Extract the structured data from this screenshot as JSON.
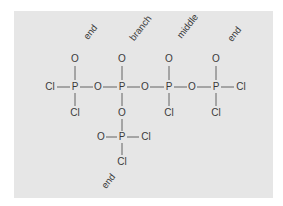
{
  "diagram": {
    "title": "",
    "background_color": "#e6e6e6",
    "text_color": "#3a3a3a",
    "labels": [
      {
        "text": "end",
        "x": 93,
        "y": 34
      },
      {
        "text": "branch",
        "x": 143,
        "y": 30
      },
      {
        "text": "middle",
        "x": 190,
        "y": 28
      },
      {
        "text": "end",
        "x": 237,
        "y": 36
      },
      {
        "text": "end",
        "x": 111,
        "y": 183
      }
    ],
    "atoms": [
      {
        "id": "cl_left",
        "symbol": "Cl",
        "x": 50,
        "y": 90
      },
      {
        "id": "p1",
        "symbol": "P",
        "x": 75,
        "y": 90
      },
      {
        "id": "p1_o_top",
        "symbol": "O",
        "x": 75,
        "y": 62
      },
      {
        "id": "p1_cl_bottom",
        "symbol": "Cl",
        "x": 75,
        "y": 116
      },
      {
        "id": "o_bridge1",
        "symbol": "O",
        "x": 98,
        "y": 90
      },
      {
        "id": "p2",
        "symbol": "P",
        "x": 122,
        "y": 90
      },
      {
        "id": "p2_o_top",
        "symbol": "O",
        "x": 122,
        "y": 62
      },
      {
        "id": "p2_o_bottom",
        "symbol": "O",
        "x": 122,
        "y": 116
      },
      {
        "id": "o_bridge2",
        "symbol": "O",
        "x": 145,
        "y": 90
      },
      {
        "id": "p3",
        "symbol": "P",
        "x": 169,
        "y": 90
      },
      {
        "id": "p3_o_top",
        "symbol": "O",
        "x": 169,
        "y": 62
      },
      {
        "id": "p3_cl_bottom",
        "symbol": "Cl",
        "x": 169,
        "y": 116
      },
      {
        "id": "o_bridge3",
        "symbol": "O",
        "x": 192,
        "y": 90
      },
      {
        "id": "p4",
        "symbol": "P",
        "x": 216,
        "y": 90
      },
      {
        "id": "p4_o_top",
        "symbol": "O",
        "x": 216,
        "y": 62
      },
      {
        "id": "p4_cl_bottom",
        "symbol": "Cl",
        "x": 216,
        "y": 116
      },
      {
        "id": "cl_right",
        "symbol": "Cl",
        "x": 241,
        "y": 90
      },
      {
        "id": "p5",
        "symbol": "P",
        "x": 122,
        "y": 140
      },
      {
        "id": "p5_o_left",
        "symbol": "O",
        "x": 101,
        "y": 140
      },
      {
        "id": "p5_cl_right",
        "symbol": "Cl",
        "x": 146,
        "y": 140
      },
      {
        "id": "p5_cl_bottom",
        "symbol": "Cl",
        "x": 122,
        "y": 165
      }
    ],
    "bonds": [
      {
        "from": "cl_left",
        "to": "p1",
        "x1": 57,
        "y1": 87,
        "x2": 70,
        "y2": 87
      },
      {
        "from": "p1",
        "to": "o_bridge1",
        "x1": 80,
        "y1": 87,
        "x2": 93,
        "y2": 87
      },
      {
        "from": "o_bridge1",
        "to": "p2",
        "x1": 103,
        "y1": 87,
        "x2": 117,
        "y2": 87
      },
      {
        "from": "p2",
        "to": "o_bridge2",
        "x1": 127,
        "y1": 87,
        "x2": 140,
        "y2": 87
      },
      {
        "from": "o_bridge2",
        "to": "p3",
        "x1": 150,
        "y1": 87,
        "x2": 164,
        "y2": 87
      },
      {
        "from": "p3",
        "to": "o_bridge3",
        "x1": 174,
        "y1": 87,
        "x2": 187,
        "y2": 87
      },
      {
        "from": "o_bridge3",
        "to": "p4",
        "x1": 197,
        "y1": 87,
        "x2": 211,
        "y2": 87
      },
      {
        "from": "p4",
        "to": "cl_right",
        "x1": 221,
        "y1": 87,
        "x2": 234,
        "y2": 87
      },
      {
        "from": "p1",
        "to": "p1_o_top",
        "x1": 75,
        "y1": 66,
        "x2": 75,
        "y2": 80
      },
      {
        "from": "p1",
        "to": "p1_cl_bottom",
        "x1": 75,
        "y1": 93,
        "x2": 75,
        "y2": 106
      },
      {
        "from": "p2",
        "to": "p2_o_top",
        "x1": 122,
        "y1": 66,
        "x2": 122,
        "y2": 80
      },
      {
        "from": "p2",
        "to": "p2_o_bottom",
        "x1": 122,
        "y1": 93,
        "x2": 122,
        "y2": 106
      },
      {
        "from": "p3",
        "to": "p3_o_top",
        "x1": 169,
        "y1": 66,
        "x2": 169,
        "y2": 80
      },
      {
        "from": "p3",
        "to": "p3_cl_bottom",
        "x1": 169,
        "y1": 93,
        "x2": 169,
        "y2": 106
      },
      {
        "from": "p4",
        "to": "p4_o_top",
        "x1": 216,
        "y1": 66,
        "x2": 216,
        "y2": 80
      },
      {
        "from": "p4",
        "to": "p4_cl_bottom",
        "x1": 216,
        "y1": 93,
        "x2": 216,
        "y2": 106
      },
      {
        "from": "p2_o_bottom",
        "to": "p5",
        "x1": 122,
        "y1": 119,
        "x2": 122,
        "y2": 131
      },
      {
        "from": "p5_o_left",
        "to": "p5",
        "x1": 106,
        "y1": 137,
        "x2": 117,
        "y2": 137
      },
      {
        "from": "p5",
        "to": "p5_cl_right",
        "x1": 127,
        "y1": 137,
        "x2": 139,
        "y2": 137
      },
      {
        "from": "p5",
        "to": "p5_cl_bottom",
        "x1": 122,
        "y1": 143,
        "x2": 122,
        "y2": 155
      }
    ]
  }
}
